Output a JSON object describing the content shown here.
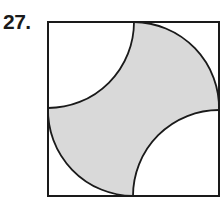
{
  "problem": {
    "number": "27."
  },
  "figure": {
    "square": {
      "x": 48,
      "y": 22,
      "width": 171,
      "height": 174
    },
    "shading_color": "#d9d9d9",
    "stroke_color": "#1a1a1a"
  }
}
